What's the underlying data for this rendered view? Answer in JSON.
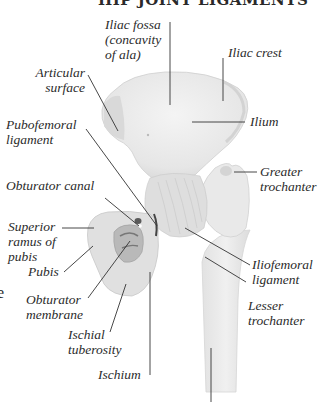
{
  "title": "HIP JOINT LIGAMENTS",
  "edge_fragment": "e",
  "labels": {
    "iliac_fossa": [
      "Iliac fossa",
      "(concavity",
      "of ala)"
    ],
    "iliac_crest": [
      "Iliac crest"
    ],
    "articular_surface": [
      "Articular",
      "surface"
    ],
    "ilium": [
      "Ilium"
    ],
    "pubofemoral_ligament": [
      "Pubofemoral",
      "ligament"
    ],
    "obturator_canal": [
      "Obturator canal"
    ],
    "greater_trochanter": [
      "Greater",
      "trochanter"
    ],
    "superior_ramus_of_pubis": [
      "Superior",
      "ramus of",
      "pubis"
    ],
    "iliofemoral_ligament": [
      "Iliofemoral",
      "ligament"
    ],
    "pubis": [
      "Pubis"
    ],
    "obturator_membrane": [
      "Obturator",
      "membrane"
    ],
    "lesser_trochanter": [
      "Lesser",
      "trochanter"
    ],
    "ischial_tuberosity": [
      "Ischial",
      "tuberosity"
    ],
    "ischium": [
      "Ischium"
    ]
  },
  "colors": {
    "background": "#ffffff",
    "bone": "#ebebeb",
    "bone_shadow": "#cfcfcf",
    "ligament": "#d8d8d8",
    "leader_line": "#333333",
    "text": "#2b2b2b"
  }
}
